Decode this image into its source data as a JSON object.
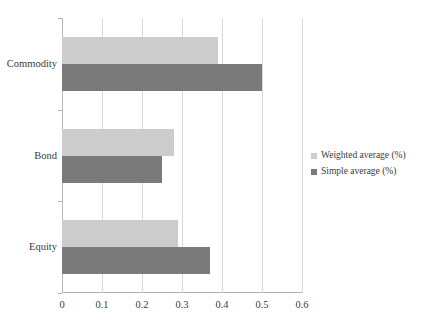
{
  "chart_data": {
    "type": "bar",
    "orientation": "horizontal",
    "title": "",
    "subtitle": "",
    "xlabel": "",
    "ylabel": "",
    "categories": [
      "Commodity",
      "Bond",
      "Equity"
    ],
    "series": [
      {
        "name": "Weighted average (%)",
        "color": "#cccccc",
        "values": [
          0.39,
          0.28,
          0.29
        ]
      },
      {
        "name": "Simple average (%)",
        "color": "#7a7a7a",
        "values": [
          0.5,
          0.25,
          0.37
        ]
      }
    ],
    "xlim": [
      0,
      0.6
    ],
    "xticks": [
      0,
      0.1,
      0.2,
      0.3,
      0.4,
      0.5,
      0.6
    ],
    "xtick_labels": [
      "0",
      "0.1",
      "0.2",
      "0.3",
      "0.4",
      "0.5",
      "0.6"
    ],
    "grid": {
      "vertical": true,
      "horizontal": false
    },
    "legend": {
      "position": "right",
      "entries": [
        "Weighted average (%)",
        "Simple average (%)"
      ]
    },
    "background_color": "#ffffff",
    "axis_color": "#b0b0b0",
    "gridline_color": "#d9d9d9"
  }
}
